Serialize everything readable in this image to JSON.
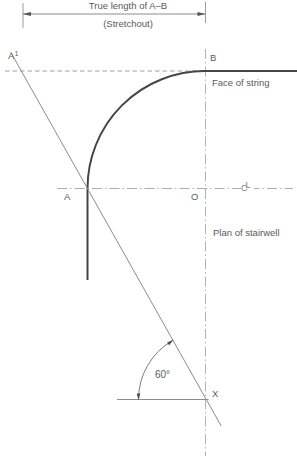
{
  "diagram": {
    "dimension": {
      "label": "True length of A–B",
      "sublabel": "(Stretchout)"
    },
    "points": {
      "a1_base": "A",
      "a1_sup": "1",
      "b": "B",
      "a": "A",
      "o": "O",
      "x": "X"
    },
    "annotations": {
      "face_of_string": "Face of string",
      "plan_of_stairwell": "Plan of stairwell",
      "angle": "60°",
      "centerline_c": "C",
      "centerline_l": "L"
    },
    "colors": {
      "line_dark": "#454545",
      "line_medium": "#8c8c8c",
      "centerline": "#b3b3b3",
      "text": "#5a5a5a"
    }
  }
}
